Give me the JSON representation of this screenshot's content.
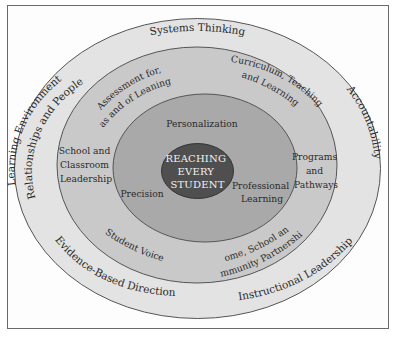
{
  "diagram": {
    "type": "concentric-ellipses",
    "colors": {
      "frame_border": "#6a6a6a",
      "ring_outer": "#e3e3e3",
      "ring_middle": "#c9c9c9",
      "ring_inner": "#a9a9a9",
      "core": "#4f4f4f",
      "core_text": "#f2f2f2",
      "text": "#2a2a2a",
      "stroke": "#555555"
    },
    "core": {
      "lines": [
        "REACHING",
        "EVERY",
        "STUDENT"
      ]
    },
    "inner_ring": {
      "labels": {
        "personalization": "Personalization",
        "precision": "Precision",
        "professional_learning": [
          "Professional",
          "Learning"
        ]
      }
    },
    "middle_ring": {
      "labels": {
        "assessment": [
          "Assessment for,",
          "as and of Leaning"
        ],
        "curriculum": [
          "Curriculum, Teaching",
          "and Learning"
        ],
        "school_leadership": [
          "School and",
          "Classroom",
          "Leadership"
        ],
        "programs": [
          "Programs",
          "and",
          "Pathways"
        ],
        "student_voice": "Student Voice",
        "home_school": [
          "Home, School and",
          "Community Partnerships"
        ]
      }
    },
    "outer_ring": {
      "labels": {
        "systems_thinking": "Systems Thinking",
        "learning_environment": [
          "Learning Environment",
          "Relationships and People"
        ],
        "accountability": "Accountability",
        "evidence": "Evidence-Based Direction",
        "instructional": "Instructional Leadership"
      }
    }
  }
}
